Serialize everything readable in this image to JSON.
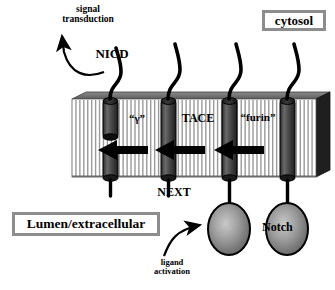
{
  "diagram": {
    "type": "biological-schematic",
    "compartments": {
      "top_label": "cytosol",
      "bottom_label": "Lumen/extracellular"
    },
    "labels": {
      "signal_transduction": "signal\ntransduction",
      "nicd": "NICD",
      "gamma": "“γ”",
      "tace": "TACE",
      "furin": "“furin”",
      "next": "NEXT",
      "notch": "Notch",
      "ligand_activation": "ligand\nactivation"
    },
    "colors": {
      "membrane_fill": "#ffffff",
      "membrane_stripe": "#9a9a9a",
      "membrane_top_face": "#6e6e6e",
      "membrane_side_face": "#2a2a2a",
      "protein_cylinder": "#4a4a4a",
      "oval_fill": "#8a8a8a",
      "box_border": "#8d8d8d",
      "ink": "#000000"
    },
    "membrane": {
      "left": 72,
      "top": 99,
      "width": 244,
      "height": 78,
      "stripe_count": 62,
      "description": "striped lipid bilayer slab drawn in pseudo-3D"
    },
    "receptors": [
      {
        "id": "receptor-1",
        "state": "cleaved-NICD-released",
        "x": 110,
        "cleaved": true,
        "has_tail_curve": true,
        "has_extracellular_oval": false
      },
      {
        "id": "receptor-2",
        "state": "NEXT-membrane-tethered",
        "x": 168,
        "cleaved": false,
        "has_tail_curve": true,
        "has_extracellular_oval": false
      },
      {
        "id": "receptor-3",
        "state": "ligand-activated-full-receptor",
        "x": 229,
        "cleaved": false,
        "has_tail_curve": true,
        "has_extracellular_oval": true
      },
      {
        "id": "receptor-4",
        "state": "mature-Notch-full-receptor",
        "x": 287,
        "cleaved": false,
        "has_tail_curve": true,
        "has_extracellular_oval": true
      }
    ],
    "process_arrows": [
      {
        "id": "arrow-gamma",
        "label": "“γ”",
        "direction": "left",
        "x_tip": 98,
        "x_tail": 148,
        "y": 150
      },
      {
        "id": "arrow-tace",
        "label": "TACE",
        "direction": "left",
        "x_tip": 155,
        "x_tail": 205,
        "y": 150
      },
      {
        "id": "arrow-furin",
        "label": "“furin”",
        "direction": "left",
        "x_tip": 214,
        "x_tail": 264,
        "y": 150
      }
    ],
    "curved_arrows": [
      {
        "id": "signal-transduction-arrow",
        "from": "NICD",
        "to": "nucleus/signal transduction",
        "direction": "up-left"
      },
      {
        "id": "ligand-activation-arrow",
        "from": "ligand activation",
        "to": "Notch extracellular domain",
        "direction": "up-right"
      }
    ]
  }
}
